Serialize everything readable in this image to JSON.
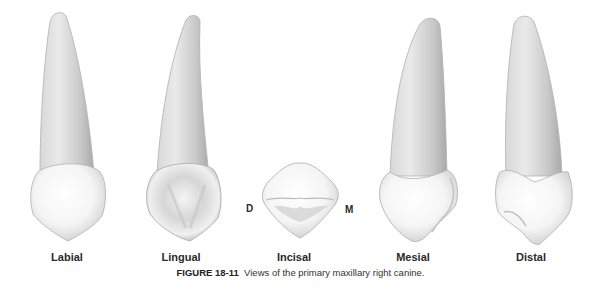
{
  "figure": {
    "number": "FIGURE 18-11",
    "caption": "Views of the primary maxillary right canine.",
    "views": [
      {
        "name": "labial",
        "label": "Labial"
      },
      {
        "name": "lingual",
        "label": "Lingual"
      },
      {
        "name": "incisal",
        "label": "Incisal"
      },
      {
        "name": "mesial",
        "label": "Mesial"
      },
      {
        "name": "distal",
        "label": "Distal"
      }
    ],
    "incisal_orientation": {
      "left": "D",
      "right": "M"
    }
  }
}
